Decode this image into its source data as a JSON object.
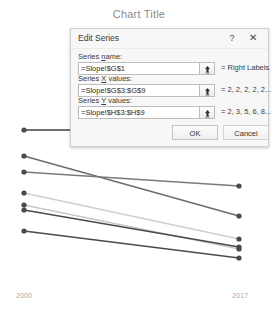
{
  "chart": {
    "title": "Chart Title",
    "axis_left_label": "2000",
    "axis_right_label": "2017"
  },
  "dialog": {
    "title": "Edit Series",
    "help_icon": "?",
    "close_icon": "✕",
    "fields": [
      {
        "label_before": "Series ",
        "label_accel": "n",
        "label_after": "ame:",
        "value": "=Slope!$G$1",
        "preview": "= Right Labels",
        "picker_icon": "range-picker-icon"
      },
      {
        "label_before": "Series ",
        "label_accel": "X",
        "label_after": " values:",
        "value": "=Slope!$G$3:$G$9",
        "preview": "= 2, 2, 2, 2, 2...",
        "picker_icon": "range-picker-icon"
      },
      {
        "label_before": "Series ",
        "label_accel": "Y",
        "label_after": " values:",
        "value": "=Slope!$H$3:$H$9",
        "preview": "= 2, 3, 5, 6, 8...",
        "picker_icon": "range-picker-icon"
      }
    ],
    "ok_label": "OK",
    "cancel_label": "Cancel"
  },
  "chart_data": {
    "type": "line",
    "title": "Chart Title",
    "xlabel": "",
    "ylabel": "",
    "x": [
      2000,
      2017
    ],
    "tick_labels": [
      "2000",
      "2017"
    ],
    "grid": false,
    "legend": "none",
    "plot_box_px": {
      "x0": 24,
      "x1": 239,
      "y_top": 130,
      "y_bottom": 268
    },
    "series": [
      {
        "name": "Series 1",
        "values": [
          130,
          130
        ],
        "color": "#3f3f3f",
        "width": 1.6,
        "px": [
          [
            24,
            130
          ],
          [
            239,
            130
          ]
        ]
      },
      {
        "name": "Series 2",
        "values": [
          156,
          216
        ],
        "color": "#6b6b6b",
        "width": 1.3,
        "px": [
          [
            24,
            156
          ],
          [
            239,
            216
          ]
        ]
      },
      {
        "name": "Series 3",
        "values": [
          172,
          186
        ],
        "color": "#7a7a7a",
        "width": 1.3,
        "px": [
          [
            24,
            172
          ],
          [
            239,
            186
          ]
        ]
      },
      {
        "name": "Series 4",
        "values": [
          193,
          239
        ],
        "color": "#cfcfcf",
        "width": 1.3,
        "px": [
          [
            24,
            193
          ],
          [
            239,
            239
          ]
        ]
      },
      {
        "name": "Series 5",
        "values": [
          205,
          249
        ],
        "color": "#c9c9c9",
        "width": 1.3,
        "px": [
          [
            24,
            205
          ],
          [
            239,
            249
          ]
        ]
      },
      {
        "name": "Series 6",
        "values": [
          210,
          247
        ],
        "color": "#4a4a4a",
        "width": 1.5,
        "px": [
          [
            24,
            210
          ],
          [
            239,
            247
          ]
        ]
      },
      {
        "name": "Series 7",
        "values": [
          231,
          258
        ],
        "color": "#4a4a4a",
        "width": 1.5,
        "px": [
          [
            24,
            231
          ],
          [
            239,
            258
          ]
        ]
      }
    ],
    "marker": {
      "shape": "circle",
      "radius": 2.6,
      "color": "#4a4a4a"
    }
  }
}
